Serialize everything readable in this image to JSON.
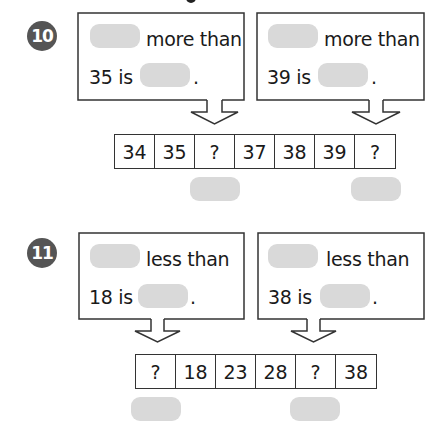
{
  "colors": {
    "badge": "#555555",
    "blank": "#d9d9d9",
    "stroke": "#333333",
    "text": "#1a1a1a"
  },
  "problems": [
    {
      "number": "10",
      "boxes": [
        {
          "line1_suffix": "more than",
          "line2_prefix": "35 is",
          "line2_end": "."
        },
        {
          "line1_suffix": "more than",
          "line2_prefix": "39 is",
          "line2_end": "."
        }
      ],
      "sequence": [
        "34",
        "35",
        "?",
        "37",
        "38",
        "39",
        "?"
      ]
    },
    {
      "number": "11",
      "boxes": [
        {
          "line1_suffix": "less than",
          "line2_prefix": "18 is",
          "line2_end": "."
        },
        {
          "line1_suffix": "less than",
          "line2_prefix": "38 is",
          "line2_end": "."
        }
      ],
      "sequence": [
        "?",
        "18",
        "23",
        "28",
        "?",
        "38"
      ]
    }
  ]
}
